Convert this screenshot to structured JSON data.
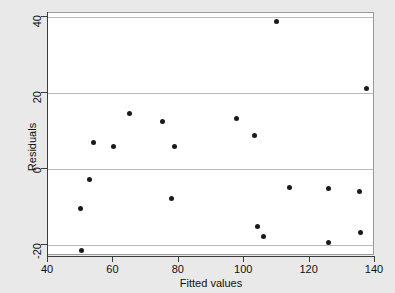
{
  "chart_data": {
    "type": "scatter",
    "title": "",
    "xlabel": "Fitted values",
    "ylabel": "Residuals",
    "xlim": [
      40,
      140
    ],
    "ylim": [
      -23,
      41
    ],
    "xticks": [
      40,
      60,
      80,
      100,
      120,
      140
    ],
    "yticks": [
      -20,
      0,
      20,
      40
    ],
    "grid": "horizontal-at-yticks",
    "legend": null,
    "marker": {
      "shape": "circle",
      "color": "#1a1a1a",
      "size": 5
    },
    "points": [
      {
        "x": 50.3,
        "y": -21.5
      },
      {
        "x": 50.0,
        "y": -10.5
      },
      {
        "x": 52.8,
        "y": -2.8
      },
      {
        "x": 53.9,
        "y": 7.0
      },
      {
        "x": 60.0,
        "y": 5.8
      },
      {
        "x": 64.8,
        "y": 14.6
      },
      {
        "x": 74.9,
        "y": 12.4
      },
      {
        "x": 78.6,
        "y": 5.8
      },
      {
        "x": 77.8,
        "y": -7.8
      },
      {
        "x": 97.5,
        "y": 13.3
      },
      {
        "x": 103.0,
        "y": 8.8
      },
      {
        "x": 104.0,
        "y": -15.2
      },
      {
        "x": 106.0,
        "y": -17.8
      },
      {
        "x": 110.0,
        "y": 38.8
      },
      {
        "x": 113.8,
        "y": -5.0
      },
      {
        "x": 125.9,
        "y": -5.1
      },
      {
        "x": 125.8,
        "y": -19.4
      },
      {
        "x": 135.2,
        "y": -6.1
      },
      {
        "x": 135.6,
        "y": -16.9
      },
      {
        "x": 137.5,
        "y": 21.0
      }
    ]
  },
  "axes": {
    "x_tick_labels": [
      "40",
      "60",
      "80",
      "100",
      "120",
      "140"
    ],
    "y_tick_labels": [
      "40",
      "20",
      "0",
      "-20"
    ],
    "x_title": "Fitted values",
    "y_title": "Residuals"
  },
  "colors": {
    "figure_background": "#e9e9e9",
    "plot_background": "#ffffff",
    "gridline": "#b8b8b8",
    "axis": "#3c3c3c",
    "marker": "#1a1a1a",
    "text": "#101010"
  }
}
